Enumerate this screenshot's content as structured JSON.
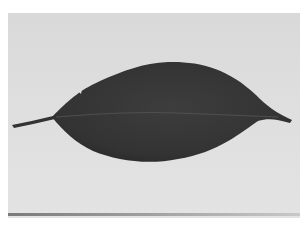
{
  "image": {
    "subject": "single dark leaf lying horizontally on a light gray background",
    "color_mode": "grayscale",
    "colors": {
      "background": "#dedede",
      "leaf": "#3a3a3a",
      "midrib": "#555555",
      "frame": "#ffffff"
    }
  }
}
